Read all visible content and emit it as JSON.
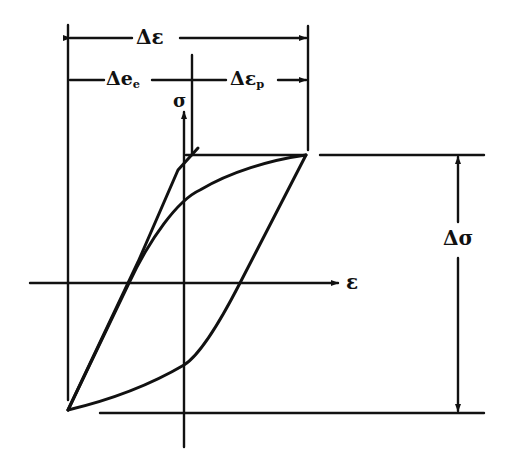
{
  "diagram": {
    "labels": {
      "total_strain_range": "Δε",
      "elastic_strain_range": "Δe",
      "elastic_sub": "e",
      "plastic_strain_range": "Δε",
      "plastic_sub": "p",
      "stress_axis": "σ",
      "strain_axis": "ε",
      "stress_range": "Δσ"
    },
    "colors": {
      "ink": "#111111",
      "background": "#ffffff"
    }
  }
}
